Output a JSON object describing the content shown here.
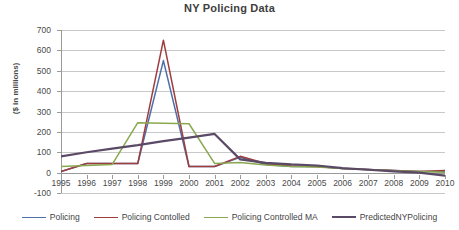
{
  "chart_data": {
    "type": "line",
    "title": "NY Policing Data",
    "xlabel": "",
    "ylabel": "($ in millions)",
    "x": [
      1995,
      1996,
      1997,
      1998,
      1999,
      2000,
      2001,
      2002,
      2003,
      2004,
      2005,
      2006,
      2007,
      2008,
      2009,
      2010
    ],
    "xtick_labels": [
      "1995",
      "1996",
      "1997",
      "1998",
      "1999",
      "2000",
      "2001",
      "2002",
      "2003",
      "2004",
      "2005",
      "2006",
      "2007",
      "2008",
      "2009",
      "2010"
    ],
    "ylim": [
      -100,
      700
    ],
    "ytick_labels": [
      "700",
      "600",
      "500",
      "400",
      "300",
      "200",
      "100",
      "0",
      "-100"
    ],
    "yticks": [
      700,
      600,
      500,
      400,
      300,
      200,
      100,
      0,
      -100
    ],
    "grid": true,
    "legend_position": "bottom",
    "series": [
      {
        "name": "Policing",
        "color": "#4f6fa8",
        "values": [
          5,
          45,
          45,
          45,
          550,
          30,
          30,
          75,
          40,
          30,
          30,
          20,
          15,
          10,
          5,
          5
        ]
      },
      {
        "name": "Policing Contolled",
        "color": "#9e3d3d",
        "values": [
          5,
          45,
          45,
          45,
          650,
          30,
          30,
          80,
          45,
          32,
          30,
          20,
          15,
          10,
          5,
          10
        ]
      },
      {
        "name": "Policing Controlled MA",
        "color": "#8aa84f",
        "values": [
          30,
          35,
          40,
          245,
          242,
          240,
          45,
          50,
          38,
          30,
          28,
          20,
          14,
          9,
          5,
          2
        ]
      },
      {
        "name": "PredictedNYPolicing",
        "color": "#5b4a66",
        "values": [
          80,
          100,
          118,
          135,
          155,
          172,
          190,
          65,
          48,
          40,
          35,
          22,
          14,
          6,
          0,
          -15
        ]
      }
    ]
  },
  "legend": {
    "items": [
      {
        "label": "Policing",
        "color": "#4f6fa8"
      },
      {
        "label": "Policing Contolled",
        "color": "#9e3d3d"
      },
      {
        "label": "Policing Controlled MA",
        "color": "#8aa84f"
      },
      {
        "label": "PredictedNYPolicing",
        "color": "#5b4a66"
      }
    ]
  }
}
